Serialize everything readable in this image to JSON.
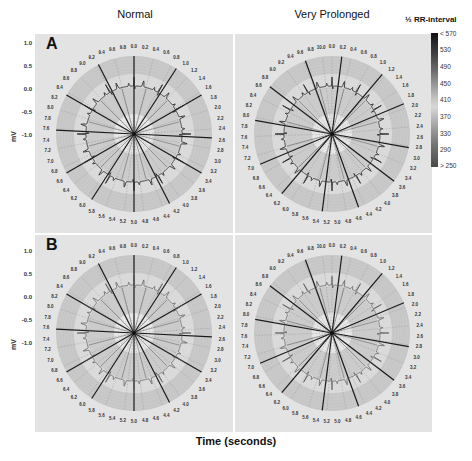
{
  "chart_data": {
    "type": "polar-line",
    "columns": [
      "Normal",
      "Very Prolonged"
    ],
    "rows": [
      "A",
      "B"
    ],
    "xlabel": "Time (seconds)",
    "ylabel": "mV",
    "y_ticks": [
      "1.0",
      "0.5",
      "0.0",
      "-0.5",
      "-1.0"
    ],
    "ylim": [
      -1.0,
      1.0
    ],
    "normal_time_ticks": [
      "0.0",
      "0.2",
      "0.4",
      "0.6",
      "0.8",
      "1.0",
      "1.2",
      "1.4",
      "1.6",
      "1.8",
      "2.0",
      "2.2",
      "2.4",
      "2.6",
      "2.8",
      "3.0",
      "3.2",
      "3.4",
      "3.6",
      "3.8",
      "4.0",
      "4.2",
      "4.4",
      "4.6",
      "4.8",
      "5.0",
      "5.2",
      "5.4",
      "5.6",
      "5.8",
      "6.0",
      "6.2",
      "6.4",
      "6.6",
      "6.8",
      "7.0",
      "7.2",
      "7.4",
      "7.6",
      "7.8",
      "8.0",
      "8.2",
      "8.4",
      "8.6",
      "8.8",
      "9.0",
      "9.2",
      "9.4",
      "9.6",
      "9.8"
    ],
    "prolonged_time_ticks": [
      "0.0",
      "0.2",
      "0.4",
      "0.6",
      "0.8",
      "1.0",
      "1.2",
      "1.4",
      "1.6",
      "1.8",
      "2.0",
      "2.2",
      "2.4",
      "2.6",
      "2.8",
      "3.0",
      "3.2",
      "3.4",
      "3.6",
      "3.8",
      "4.0",
      "4.2",
      "4.4",
      "4.6",
      "4.8",
      "5.0",
      "5.2",
      "5.4",
      "5.6",
      "5.8",
      "6.0",
      "6.2",
      "6.4",
      "6.6",
      "6.8",
      "7.0",
      "7.2",
      "7.4",
      "7.6",
      "7.8",
      "8.0",
      "8.2",
      "8.4",
      "8.6",
      "8.8",
      "9.0",
      "9.2",
      "9.4",
      "9.6",
      "9.8",
      "10.0"
    ],
    "r_peak_count": 12,
    "colorbar": {
      "title": "½ RR-interval",
      "labels": [
        "< 570",
        "530",
        "490",
        "450",
        "410",
        "370",
        "330",
        "290",
        "> 250"
      ]
    }
  },
  "titles": {
    "col_left": "Normal",
    "col_right": "Very Prolonged",
    "colorbar": "½ RR-interval",
    "x_axis": "Time (seconds)"
  },
  "panels": {
    "A": {
      "letter": "A"
    },
    "B": {
      "letter": "B"
    }
  },
  "yaxis": {
    "label": "mV",
    "ticks": [
      "1.0",
      "0.5",
      "0.0",
      "-0.5",
      "-1.0"
    ]
  },
  "colorbar": {
    "labels": [
      "< 570",
      "530",
      "490",
      "450",
      "410",
      "370",
      "330",
      "290",
      "> 250"
    ]
  }
}
